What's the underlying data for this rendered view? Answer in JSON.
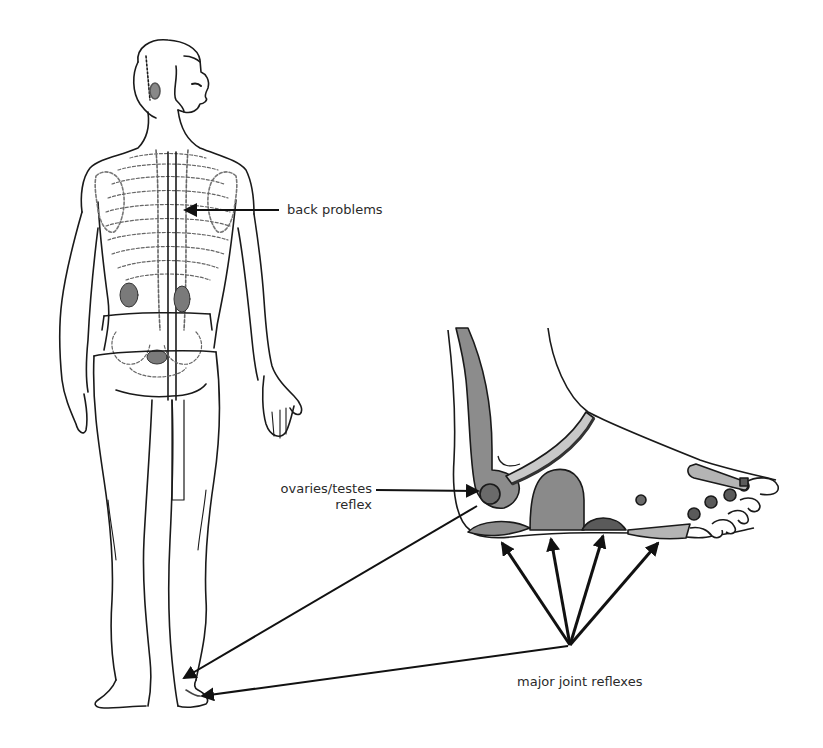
{
  "diagram": {
    "labels": {
      "back_problems": "back problems",
      "ovaries_testes_line1": "ovaries/testes",
      "ovaries_testes_line2": "reflex",
      "major_joint_reflexes": "major joint reflexes"
    },
    "figures": {
      "body": "rear view of standing male figure showing spine, ribs, kidneys and pelvis",
      "foot": "side view of foot with shaded reflex zones"
    },
    "colors": {
      "line": "#1a1a1a",
      "zone_mid_gray": "#8c8c8c",
      "zone_dark_gray": "#5a5a5a",
      "zone_light_gray": "#b4b4b4",
      "organ_gray": "#7a7a7a",
      "background": "#ffffff"
    }
  }
}
